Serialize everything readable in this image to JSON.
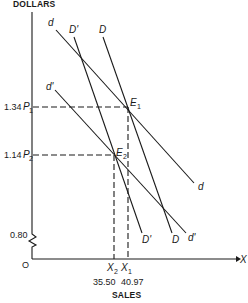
{
  "axes": {
    "y_label": "DOLLARS",
    "x_label": "SALES",
    "x_arrow_label": "X",
    "origin_label": "O",
    "y_break_value": "0.80"
  },
  "prices": [
    {
      "value": "1.34",
      "symbol": "P",
      "sub": "1"
    },
    {
      "value": "1.14",
      "symbol": "P",
      "sub": "2"
    }
  ],
  "quantities": [
    {
      "value": "35.50",
      "symbol": "X",
      "sub": "2"
    },
    {
      "value": "40.97",
      "symbol": "X",
      "sub": "1"
    }
  ],
  "equilibria": [
    {
      "symbol": "E",
      "sub": "1"
    },
    {
      "symbol": "E",
      "sub": "2"
    }
  ],
  "curves": {
    "d": {
      "top": "d",
      "bottom": "d"
    },
    "d_prime": {
      "top": "d'",
      "bottom": "d'"
    },
    "D": {
      "top": "D",
      "bottom": "D"
    },
    "D_prime": {
      "top": "D'",
      "bottom": "D'"
    }
  }
}
